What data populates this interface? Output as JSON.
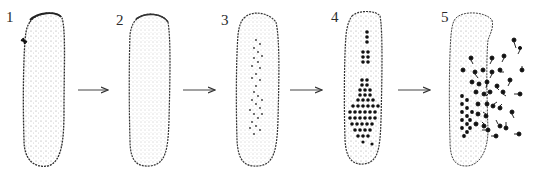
{
  "figure": {
    "stages": [
      {
        "label": "1",
        "state": "undivided cell with apical mark"
      },
      {
        "label": "2",
        "state": "cytoplasm granular"
      },
      {
        "label": "3",
        "state": "fine dots appearing along axis"
      },
      {
        "label": "4",
        "state": "spores organized in grid"
      },
      {
        "label": "5",
        "state": "flagellated spores released"
      }
    ],
    "arrows": [
      "1→2",
      "2→3",
      "3→4",
      "4→5"
    ],
    "colors": {
      "ink": "#222222",
      "stipple": "#7a7a7a",
      "background": "#ffffff"
    }
  }
}
